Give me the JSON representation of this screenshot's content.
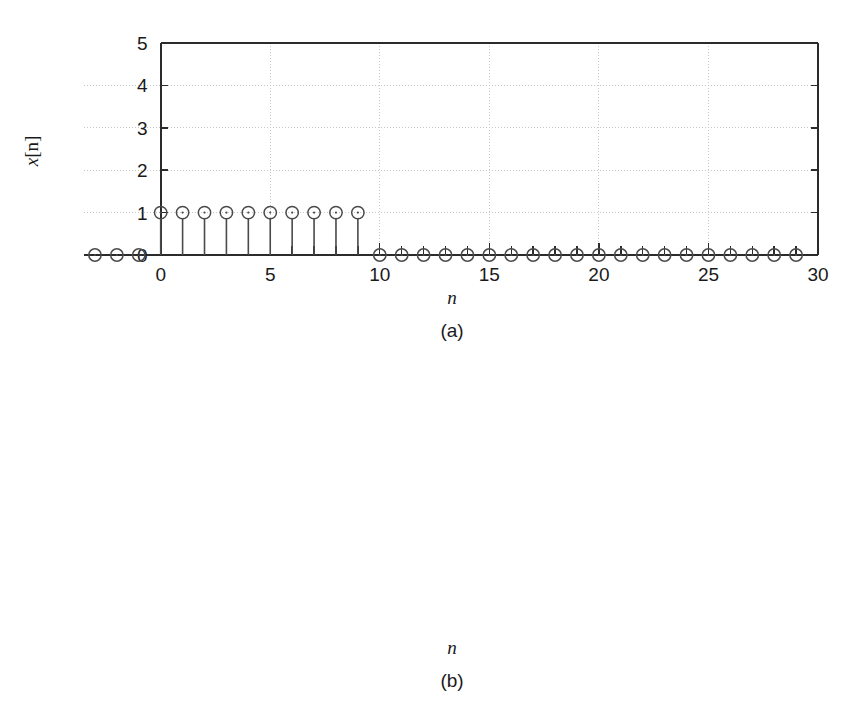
{
  "figure": {
    "background_color": "#ffffff",
    "axis_color": "#2b2b2b",
    "grid_color": "#c8c8c8",
    "marker_color": "#4a4a4a"
  },
  "panels": [
    {
      "id": "a",
      "caption": "(a)",
      "ylabel_var": "x",
      "ylabel_index": "[n]",
      "xlabel": "n"
    },
    {
      "id": "b",
      "caption": "(b)",
      "ylabel_var": "y",
      "ylabel_index": "[n]",
      "xlabel": "n"
    }
  ],
  "chart_data": [
    {
      "type": "scatter",
      "subtype": "stem",
      "title": "",
      "panel_caption": "(a)",
      "xlabel": "n",
      "ylabel": "x[n]",
      "xlim": [
        -3.5,
        30
      ],
      "ylim": [
        0,
        5
      ],
      "xticks": [
        0,
        5,
        10,
        15,
        20,
        25,
        30
      ],
      "xtick_labels": [
        "0",
        "5",
        "10",
        "15",
        "20",
        "25",
        "30"
      ],
      "yticks": [
        0,
        1,
        2,
        3,
        4,
        5
      ],
      "ytick_labels": [
        "0",
        "1",
        "2",
        "3",
        "4",
        "5"
      ],
      "grid": true,
      "legend": "none",
      "x": [
        -3,
        -2,
        -1,
        0,
        1,
        2,
        3,
        4,
        5,
        6,
        7,
        8,
        9,
        10,
        11,
        12,
        13,
        14,
        15,
        16,
        17,
        18,
        19,
        20,
        21,
        22,
        23,
        24,
        25,
        26,
        27,
        28,
        29
      ],
      "values": [
        0,
        0,
        0,
        1,
        1,
        1,
        1,
        1,
        1,
        1,
        1,
        1,
        1,
        0,
        0,
        0,
        0,
        0,
        0,
        0,
        0,
        0,
        0,
        0,
        0,
        0,
        0,
        0,
        0,
        0,
        0,
        0,
        0
      ]
    },
    {
      "type": "scatter",
      "subtype": "stem",
      "title": "",
      "panel_caption": "(b)",
      "xlabel": "n",
      "ylabel": "y[n]",
      "xlim": [
        -3.5,
        30
      ],
      "ylim": [
        0,
        6
      ],
      "xticks": [
        0,
        5,
        10,
        15,
        20,
        25,
        30
      ],
      "xtick_labels": [
        "0",
        "5",
        "10",
        "15",
        "20",
        "25",
        "30"
      ],
      "yticks": [
        0,
        2,
        4,
        6
      ],
      "ytick_labels": [
        "0",
        "2",
        "4",
        "6"
      ],
      "grid": true,
      "legend": "none",
      "x": [
        -3,
        -2,
        -1,
        0,
        1,
        2,
        3,
        4,
        5,
        6,
        7,
        8,
        9,
        10,
        11,
        12,
        13,
        14,
        15,
        16,
        17,
        18,
        19,
        20,
        21,
        22,
        23,
        24,
        25,
        26,
        27,
        28,
        29
      ],
      "values": [
        0,
        0,
        0,
        1.0,
        1.8,
        2.4,
        2.9,
        3.35,
        3.6,
        3.9,
        4.1,
        4.25,
        4.35,
        3.5,
        2.75,
        2.15,
        1.65,
        1.3,
        1.05,
        0.85,
        0.65,
        0.5,
        0.4,
        0.3,
        0.22,
        0.18,
        0.13,
        0.1,
        0.08,
        0.05,
        0.04,
        0.03,
        0.02
      ]
    }
  ]
}
